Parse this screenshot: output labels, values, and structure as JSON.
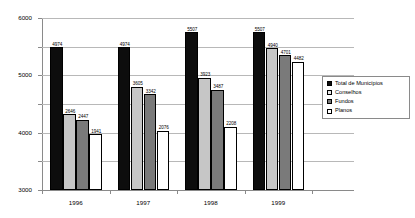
{
  "chart_data": {
    "type": "bar",
    "title": "",
    "xlabel": "",
    "ylabel": "",
    "categories": [
      "1996",
      "1997",
      "1998",
      "1999"
    ],
    "series": [
      {
        "name": "Total de Municípios",
        "color": "#0d0d0d",
        "values": [
          4974,
          4974,
          5507,
          5507
        ]
      },
      {
        "name": "Conselhos",
        "color": "#c6c6c6",
        "values": [
          2646,
          3605,
          3923,
          4940
        ]
      },
      {
        "name": "Fundos",
        "color": "#7a7a7a",
        "values": [
          2447,
          3342,
          3487,
          4701
        ]
      },
      {
        "name": "Planos",
        "color": "#ffffff",
        "values": [
          1941,
          2076,
          2208,
          4482
        ]
      }
    ],
    "ylim": [
      0,
      6000
    ],
    "yticks": [
      0,
      1000,
      2000,
      3000,
      4000,
      5000,
      6000
    ],
    "ytick_labels": [
      "0",
      "1000",
      "2000",
      "3000",
      "4000",
      "5000",
      "6000"
    ],
    "grid": true,
    "legend_position": "right",
    "data_labels": true
  },
  "legend": {
    "items": [
      {
        "label": "Total de Municípios",
        "swatch": "s-total"
      },
      {
        "label": "Conselhos",
        "swatch": "s-cons"
      },
      {
        "label": "Fundos",
        "swatch": "s-fundos"
      },
      {
        "label": "Planos",
        "swatch": "s-planos"
      }
    ]
  }
}
